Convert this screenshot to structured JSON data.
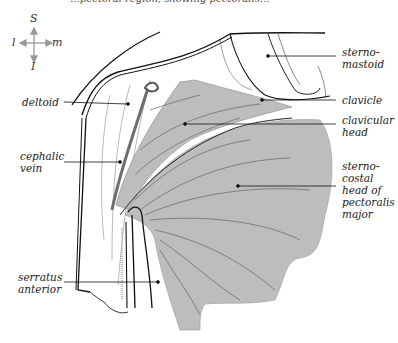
{
  "caption": "…pectoral region, showing pectoralis…",
  "compass": {
    "top": "S",
    "left": "l",
    "right": "m",
    "bottom": "I"
  },
  "labels": {
    "sternomastoid": "sterno-\nmastoid",
    "clavicle": "clavicle",
    "deltoid": "deltoid",
    "clavicular_head": "clavicular\nhead",
    "cephalic_vein": "cephalic\nvein",
    "sternocostal_head": "sterno-\ncostal\nhead of\npectoralis\nmajor",
    "serratus_anterior": "serratus\nanterior"
  },
  "colors": {
    "muscle_fill": "#bdbdbd",
    "vein": "#6e6e6e",
    "line": "#111111"
  }
}
